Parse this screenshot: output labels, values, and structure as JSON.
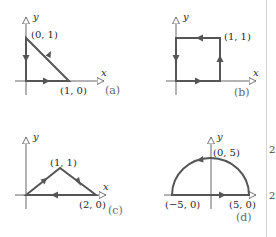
{
  "figure": {
    "colors": {
      "path": "#555555",
      "axis": "#666666",
      "text": "#2a2a2a",
      "tag": "#6a6a6a"
    },
    "panels": [
      {
        "id": "a",
        "tag": "(a)",
        "axis_x": "x",
        "axis_y": "y",
        "shape": "triangle",
        "points": [
          {
            "label": "(0, 1)",
            "coords": [
              0,
              1
            ]
          },
          {
            "label": "(1, 0)",
            "coords": [
              1,
              0
            ]
          }
        ],
        "orientation": "counterclockwise",
        "path_description": "origin → (1,0) → (0,1) → origin"
      },
      {
        "id": "b",
        "tag": "(b)",
        "axis_x": "x",
        "axis_y": "y",
        "shape": "square",
        "points": [
          {
            "label": "(1, 1)",
            "coords": [
              1,
              1
            ]
          }
        ],
        "orientation": "counterclockwise",
        "path_description": "origin → (1,0) → (1,1) → (0,1) → origin"
      },
      {
        "id": "c",
        "tag": "(c)",
        "axis_x": "x",
        "axis_y": "y",
        "shape": "triangle",
        "points": [
          {
            "label": "(1, 1)",
            "coords": [
              1,
              1
            ]
          },
          {
            "label": "(2, 0)",
            "coords": [
              2,
              0
            ]
          }
        ],
        "orientation": "clockwise",
        "path_description": "origin → (1,1) → (2,0) → origin"
      },
      {
        "id": "d",
        "tag": "(d)",
        "axis_x": "",
        "axis_y": "y",
        "shape": "semicircle",
        "points": [
          {
            "label": "(0, 5)",
            "coords": [
              0,
              5
            ]
          },
          {
            "label": "(−5, 0)",
            "coords": [
              -5,
              0
            ]
          },
          {
            "label": "(5, 0)",
            "coords": [
              5,
              0
            ]
          }
        ],
        "orientation": "counterclockwise",
        "path_description": "(−5,0) → (5,0) along x-axis, then arc over (0,5) back to (−5,0)"
      }
    ]
  },
  "edge_marks": [
    "2",
    "2"
  ]
}
